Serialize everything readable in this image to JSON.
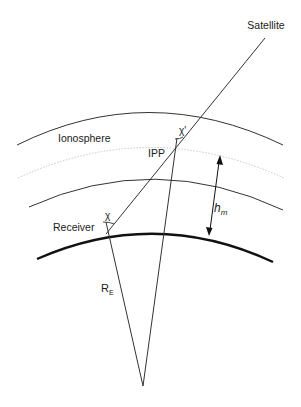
{
  "diagram": {
    "title_hint": "Ionospheric single-layer model geometry",
    "labels": {
      "satellite": "Satellite",
      "ionosphere": "Ionosphere",
      "ipp": "IPP",
      "receiver": "Receiver",
      "chi": "χ",
      "chi_prime": "χ'",
      "h": "h",
      "h_sub": "m",
      "r": "R",
      "r_sub": "E"
    },
    "colors": {
      "line": "#333333",
      "earth": "#111111",
      "dotted_shell": "#c8c8c8",
      "background": "#ffffff"
    },
    "elements": {
      "earth_surface": "thick arc",
      "ionosphere_outer_boundary": "thin arc",
      "ionosphere_mean_shell": "dotted light arc",
      "ionosphere_inner_boundary": "thin arc",
      "line_of_sight": "Receiver to Satellite",
      "radii": "Earth center to Receiver and to IPP",
      "height_arrow": "double-headed arrow h_m between Earth surface and mean shell"
    }
  }
}
